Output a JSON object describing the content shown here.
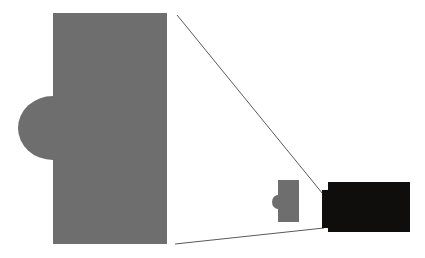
{
  "canvas": {
    "width": 425,
    "height": 258,
    "background_color": "#ffffff",
    "title": "magnified-detail-callout-diagram"
  },
  "palette": {
    "primary_gray": "#6e6e6e",
    "detail_black": "#100d0d",
    "callout_line": "#5a5a5a",
    "background": "#ffffff"
  },
  "shapes": {
    "main_body": {
      "label": "main-gray-body",
      "fill": "#6e6e6e",
      "rect": {
        "x": 53,
        "y": 13,
        "width": 114,
        "height": 231
      }
    },
    "main_bump": {
      "label": "main-gray-left-bump",
      "fill": "#6e6e6e",
      "ellipse": {
        "cx": 53,
        "cy": 128,
        "rx": 35,
        "ry": 32
      }
    },
    "mini_body": {
      "label": "mini-gray-body",
      "fill": "#6e6e6e",
      "rect": {
        "x": 278,
        "y": 180,
        "width": 21,
        "height": 42
      }
    },
    "mini_bump": {
      "label": "mini-gray-left-bump",
      "fill": "#6e6e6e",
      "ellipse": {
        "cx": 278,
        "cy": 202,
        "rx": 6,
        "ry": 7
      }
    },
    "detail_block": {
      "label": "detail-black-block",
      "fill": "#100d0d",
      "rect": {
        "x": 328,
        "y": 182,
        "width": 82,
        "height": 50
      }
    },
    "detail_tab": {
      "label": "detail-black-left-tab",
      "fill": "#100d0d",
      "rect": {
        "x": 322,
        "y": 190,
        "width": 8,
        "height": 38
      }
    }
  },
  "callouts": {
    "upper_line": {
      "label": "upper-callout-line",
      "x1": 177,
      "y1": 15,
      "x2": 327,
      "y2": 199,
      "stroke": "#5a5a5a",
      "stroke_width": 1
    },
    "lower_line": {
      "label": "lower-callout-line",
      "x1": 175,
      "y1": 244,
      "x2": 324,
      "y2": 228,
      "stroke": "#5a5a5a",
      "stroke_width": 1
    }
  }
}
